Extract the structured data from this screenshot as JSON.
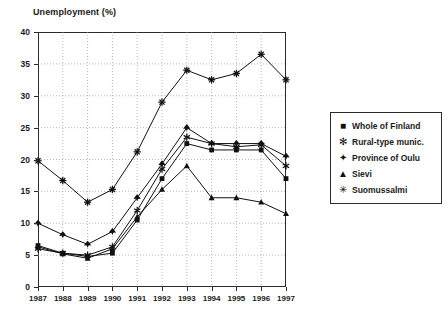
{
  "chart_data": {
    "type": "line",
    "title": "",
    "ylabel": "Unemployment (%)",
    "xlabel": "",
    "ylim": [
      0,
      40
    ],
    "ystep": 5,
    "grid": true,
    "legend_position": "right-outside",
    "categories": [
      "1987",
      "1988",
      "1989",
      "1990",
      "1991",
      "1992",
      "1993",
      "1994",
      "1995",
      "1996",
      "1997"
    ],
    "yticks": [
      "0",
      "5",
      "10",
      "15",
      "20",
      "25",
      "30",
      "35",
      "40"
    ],
    "series": [
      {
        "name": "Whole of Finland",
        "marker": "filled-square",
        "values": [
          6.5,
          5.3,
          4.8,
          5.3,
          10.5,
          17.0,
          22.5,
          21.5,
          21.5,
          21.5,
          17.0
        ]
      },
      {
        "name": "Rural-type munic.",
        "marker": "six-point-star",
        "values": [
          6.0,
          5.3,
          5.0,
          6.3,
          12.0,
          18.5,
          23.5,
          22.5,
          22.0,
          22.3,
          19.0
        ]
      },
      {
        "name": "Province of Oulu",
        "marker": "four-point-diamond",
        "values": [
          10.0,
          8.2,
          6.7,
          8.7,
          14.0,
          19.3,
          25.0,
          22.5,
          22.5,
          22.5,
          20.5
        ]
      },
      {
        "name": "Sievi",
        "marker": "filled-triangle",
        "values": [
          6.3,
          5.2,
          4.5,
          6.0,
          11.0,
          15.3,
          19.0,
          14.0,
          14.0,
          13.3,
          11.5
        ]
      },
      {
        "name": "Suomussalmi",
        "marker": "eight-point-asterisk",
        "values": [
          19.8,
          16.7,
          13.3,
          15.3,
          21.2,
          29.0,
          34.0,
          32.5,
          33.5,
          36.5,
          32.5
        ]
      }
    ]
  }
}
